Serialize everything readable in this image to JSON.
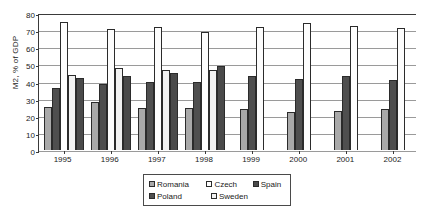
{
  "chart_data": {
    "type": "bar",
    "title": "",
    "xlabel": "",
    "ylabel": "M2, % of GDP",
    "ylim": [
      0,
      80
    ],
    "ytick_step": 10,
    "yticks": [
      0,
      10,
      20,
      30,
      40,
      50,
      60,
      70,
      80
    ],
    "grid": true,
    "legend_position": "bottom",
    "categories": [
      "1995",
      "1996",
      "1997",
      "1998",
      "1999",
      "2000",
      "2001",
      "2002"
    ],
    "series": [
      {
        "name": "Romania",
        "color": "#a9a9a9",
        "values": [
          25,
          28,
          24.5,
          24.5,
          24,
          22,
          22.5,
          24
        ]
      },
      {
        "name": "Poland",
        "color": "#4f4f4f",
        "values": [
          36,
          38.5,
          40,
          40,
          43,
          41.5,
          43,
          41
        ]
      },
      {
        "name": "Czech",
        "color": "#fdfdfd",
        "values": [
          75,
          70.5,
          72,
          69,
          72,
          74,
          72.5,
          71.5
        ]
      },
      {
        "name": "Sweden",
        "color": "#f2f2f2",
        "values": [
          44,
          48,
          47,
          46.5,
          null,
          null,
          null,
          null
        ]
      },
      {
        "name": "Spain",
        "color": "#4a4a4a",
        "values": [
          42,
          43.5,
          45,
          49,
          null,
          null,
          null,
          null
        ]
      }
    ]
  },
  "axis": {
    "y_title": "M2, % of GDP",
    "y_tick_labels": [
      "80",
      "70",
      "60",
      "50",
      "40",
      "30",
      "20",
      "10",
      "0"
    ],
    "x_tick_labels": [
      "1995",
      "1996",
      "1997",
      "1998",
      "1999",
      "2000",
      "2001",
      "2002"
    ]
  },
  "legend": {
    "row1": [
      {
        "label": "Romania",
        "swatch": "s-romania",
        "width": "w-romania"
      },
      {
        "label": "Czech",
        "swatch": "s-czech",
        "width": "w-czech"
      },
      {
        "label": "Spain",
        "swatch": "s-spain",
        "width": "w-spain"
      }
    ],
    "row2": [
      {
        "label": "Poland",
        "swatch": "s-poland",
        "width": "w-poland"
      },
      {
        "label": "Sweden",
        "swatch": "s-sweden",
        "width": "w-sweden"
      }
    ]
  }
}
